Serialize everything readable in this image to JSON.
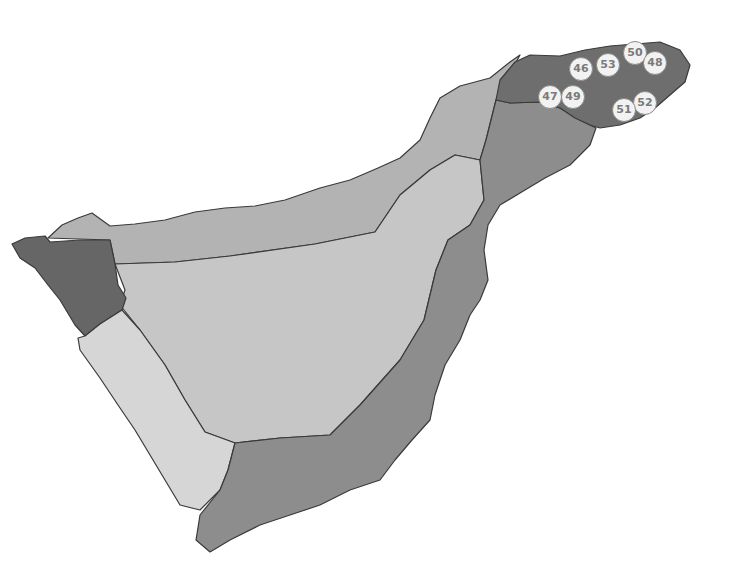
{
  "map": {
    "type": "choropleth-island",
    "colors": {
      "background": "#ffffff",
      "north_coast": "#b3b3b3",
      "center": "#c6c6c6",
      "west_tip": "#666666",
      "southwest": "#d6d6d6",
      "south_east": "#8d8d8d",
      "northeast_tip": "#6e6e6e",
      "border": "#3a3a3a"
    },
    "markers": [
      {
        "label": "46",
        "x": 580,
        "y": 68
      },
      {
        "label": "53",
        "x": 607,
        "y": 64
      },
      {
        "label": "50",
        "x": 634,
        "y": 52
      },
      {
        "label": "48",
        "x": 654,
        "y": 62
      },
      {
        "label": "47",
        "x": 549,
        "y": 96
      },
      {
        "label": "49",
        "x": 572,
        "y": 96
      },
      {
        "label": "52",
        "x": 644,
        "y": 102
      },
      {
        "label": "51",
        "x": 623,
        "y": 109
      }
    ]
  }
}
